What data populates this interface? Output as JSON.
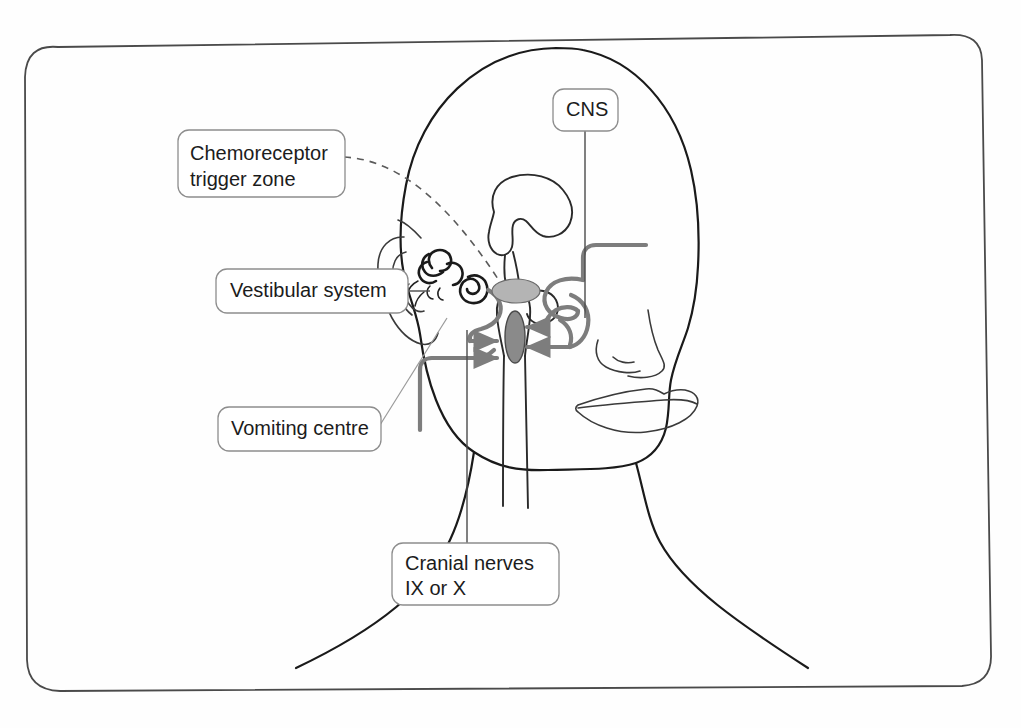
{
  "figure": {
    "type": "anatomical-diagram",
    "background_color": "#fefefe",
    "line_color": "#1a1a1a",
    "pathway_color": "#7d7d7d",
    "structure_fill": "#b4b4b4"
  },
  "labels": {
    "ctz": {
      "line1": "Chemoreceptor",
      "line2": "trigger zone",
      "connector": "dashed"
    },
    "vestibular": {
      "text": "Vestibular system",
      "connector": "solid"
    },
    "vomiting_centre": {
      "text": "Vomiting centre",
      "connector": "solid-diagonal"
    },
    "cns": {
      "text": "CNS",
      "connector": "vertical"
    },
    "cranial_nerves": {
      "line1": "Cranial nerves",
      "line2": "IX or X",
      "connector": "vertical"
    }
  },
  "structures": {
    "ctz_node": "chemoreceptor-trigger-zone",
    "vomiting_centre_node": "vomiting-centre",
    "brain": "brain-outline",
    "vestibular_apparatus": "semicircular-canals-and-cochlea",
    "ear": "outer-ear-pinna",
    "spinal_cord": "spinal-cord",
    "nose": "nose-profile",
    "lips": "lips-profile",
    "head": "head-outline",
    "shoulders": "shoulders-outline"
  },
  "arrows": {
    "into_vomiting_centre": 4,
    "description": "afferent inputs converging on the vomiting centre"
  }
}
